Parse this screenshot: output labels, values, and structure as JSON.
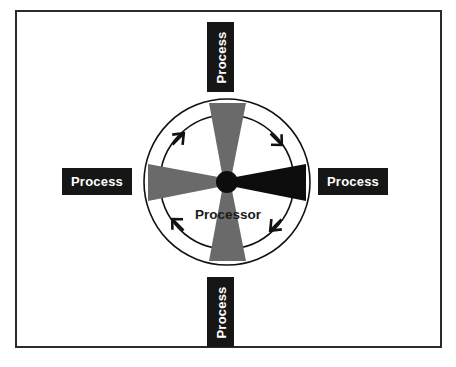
{
  "figure": {
    "type": "diagram",
    "subtype": "radial-hub-and-spoke",
    "background_color": "#ffffff",
    "frame": {
      "border_color": "#2b2b2b",
      "border_width_px": 2,
      "fill": "#ffffff"
    },
    "center_caption": "Processor",
    "center_caption_color": "#1a1a1a",
    "hub": {
      "name": "processor-hub",
      "color": "#0d0d0d",
      "center_x": 227,
      "center_y": 182,
      "radius": 11
    },
    "circles": [
      {
        "name": "outer-circle",
        "center_x": 227,
        "center_y": 182,
        "radius": 83,
        "stroke": "#111111",
        "stroke_width": 1.6,
        "fill": "none"
      },
      {
        "name": "inner-circle",
        "center_x": 227,
        "center_y": 182,
        "radius": 67,
        "stroke": "#111111",
        "stroke_width": 1.6,
        "fill": "none"
      }
    ],
    "blades": [
      {
        "name": "blade-top",
        "direction": "up",
        "angle_deg": 270,
        "color": "#6a6a6a",
        "tip_half_width_deg": 4,
        "outer_half_width_deg": 13,
        "outer_radius": 80
      },
      {
        "name": "blade-right",
        "direction": "right",
        "angle_deg": 0,
        "color": "#0d0d0d",
        "tip_half_width_deg": 4,
        "outer_half_width_deg": 13,
        "outer_radius": 80
      },
      {
        "name": "blade-bottom",
        "direction": "down",
        "angle_deg": 90,
        "color": "#6a6a6a",
        "tip_half_width_deg": 4,
        "outer_half_width_deg": 13,
        "outer_radius": 80
      },
      {
        "name": "blade-left",
        "direction": "left",
        "angle_deg": 180,
        "color": "#6a6a6a",
        "tip_half_width_deg": 4,
        "outer_half_width_deg": 13,
        "outer_radius": 80
      }
    ],
    "rotation_arrows": {
      "direction": "clockwise",
      "color": "#111111",
      "count": 4,
      "positions_deg": [
        225,
        315,
        45,
        135
      ]
    },
    "labels": [
      {
        "id": "label-top",
        "text": "Process",
        "orientation": "vertical-bottom-to-top",
        "background": "#161616",
        "text_color": "#ffffff"
      },
      {
        "id": "label-right",
        "text": "Process",
        "orientation": "horizontal",
        "background": "#161616",
        "text_color": "#ffffff"
      },
      {
        "id": "label-bottom",
        "text": "Process",
        "orientation": "vertical-bottom-to-top",
        "background": "#161616",
        "text_color": "#ffffff"
      },
      {
        "id": "label-left",
        "text": "Process",
        "orientation": "horizontal",
        "background": "#161616",
        "text_color": "#ffffff"
      }
    ]
  }
}
